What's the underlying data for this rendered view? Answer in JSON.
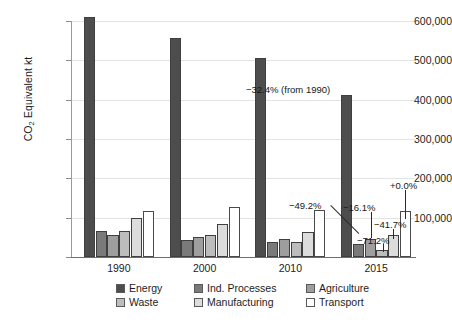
{
  "chart_data": {
    "type": "bar",
    "title": "",
    "xlabel": "",
    "ylabel": "CO2 Equivalent kt",
    "ylabel_parts": {
      "pre": "CO",
      "sub": "2",
      "post": " Equivalent kt"
    },
    "categories": [
      "1990",
      "2000",
      "2010",
      "2015"
    ],
    "ylim": [
      0,
      600000
    ],
    "yticks": [
      100000,
      200000,
      300000,
      400000,
      500000,
      600000
    ],
    "ytick_labels": [
      "100,000",
      "200,000",
      "300,000",
      "400,000",
      "500,000",
      "600,000"
    ],
    "grid": true,
    "legend_position": "bottom",
    "series": [
      {
        "name": "Energy",
        "color": "#4d4d4d",
        "values": [
          611000,
          558000,
          505000,
          413000
        ]
      },
      {
        "name": "Ind. Processes",
        "color": "#7a7a7a",
        "values": [
          66000,
          42000,
          38000,
          34000
        ]
      },
      {
        "name": "Agriculture",
        "color": "#9e9e9e",
        "values": [
          55000,
          50000,
          47000,
          46000
        ]
      },
      {
        "name": "Waste",
        "color": "#bdbdbd",
        "values": [
          66000,
          57000,
          37000,
          19000
        ]
      },
      {
        "name": "Manufacturing",
        "color": "#dcdcdc",
        "values": [
          98000,
          85000,
          64000,
          57000
        ]
      },
      {
        "name": "Transport",
        "color": "#ffffff",
        "values": [
          118000,
          127000,
          120000,
          118000
        ]
      }
    ],
    "annotations": [
      {
        "text": "-32.4% (from 1990)",
        "series": "Energy"
      },
      {
        "text": "-49.2%",
        "series": "Ind. Processes"
      },
      {
        "text": "-16.1%",
        "series": "Agriculture"
      },
      {
        "text": "-71.2%",
        "series": "Waste"
      },
      {
        "text": "-41.7%",
        "series": "Manufacturing"
      },
      {
        "text": "+0.0%",
        "series": "Transport"
      }
    ]
  },
  "axis": {
    "ytick_0": "600,000",
    "ytick_1": "500,000",
    "ytick_2": "400,000",
    "ytick_3": "300,000",
    "ytick_4": "200,000",
    "ytick_5": "100,000",
    "xtick_0": "1990",
    "xtick_1": "2000",
    "xtick_2": "2010",
    "xtick_3": "2015"
  },
  "legend": {
    "items": [
      {
        "label": "Energy"
      },
      {
        "label": "Ind. Processes"
      },
      {
        "label": "Agriculture"
      },
      {
        "label": "Waste"
      },
      {
        "label": "Manufacturing"
      },
      {
        "label": "Transport"
      }
    ]
  },
  "annotations": {
    "energy": "−32.4% (from 1990)",
    "ind_processes": "−49.2%",
    "agriculture": "−16.1%",
    "waste": "−71.2%",
    "manufacturing": "−41.7%",
    "transport": "+0.0%"
  }
}
